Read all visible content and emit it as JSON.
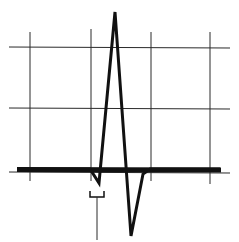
{
  "diagram": {
    "colors": {
      "background": "#ffffff",
      "grid": "#2a2a2a",
      "trace": "#111111"
    },
    "grid": {
      "vertical_x": [
        30,
        91,
        151,
        210
      ],
      "horizontal_y": [
        47,
        108,
        172
      ]
    },
    "trace_points": [
      [
        17,
        169
      ],
      [
        90,
        169
      ],
      [
        99,
        183
      ],
      [
        115,
        12
      ],
      [
        131,
        236
      ],
      [
        143,
        174
      ],
      [
        150,
        169
      ],
      [
        220,
        169
      ]
    ],
    "q_wave_marker": {
      "bracket_x": [
        90,
        104
      ],
      "bracket_y": 197,
      "stem_x": 97,
      "stem_bottom": 240
    }
  }
}
